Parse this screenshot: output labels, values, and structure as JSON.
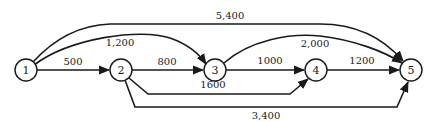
{
  "diagram": {
    "type": "directed-network",
    "nodes": [
      {
        "id": "1",
        "label": "1",
        "x": 26,
        "y": 70
      },
      {
        "id": "2",
        "label": "2",
        "x": 121,
        "y": 70
      },
      {
        "id": "3",
        "label": "3",
        "x": 215,
        "y": 70
      },
      {
        "id": "4",
        "label": "4",
        "x": 316,
        "y": 70
      },
      {
        "id": "5",
        "label": "5",
        "x": 411,
        "y": 70
      }
    ],
    "edges": [
      {
        "from": "1",
        "to": "2",
        "label": "500"
      },
      {
        "from": "1",
        "to": "3",
        "label": "1,200"
      },
      {
        "from": "1",
        "to": "5",
        "label": "5,400"
      },
      {
        "from": "2",
        "to": "3",
        "label": "800"
      },
      {
        "from": "2",
        "to": "4",
        "label": "1600"
      },
      {
        "from": "2",
        "to": "5",
        "label": "3,400"
      },
      {
        "from": "3",
        "to": "4",
        "label": "1000"
      },
      {
        "from": "3",
        "to": "5",
        "label": "2,000"
      },
      {
        "from": "4",
        "to": "5",
        "label": "1200"
      }
    ],
    "colors": {
      "stroke": "#1a1a1a",
      "background": "#ffffff"
    }
  }
}
